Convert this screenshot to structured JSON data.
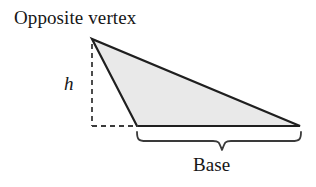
{
  "figure": {
    "kind": "geometry-diagram",
    "background_color": "#ffffff",
    "labels": {
      "opposite_vertex": "Opposite vertex",
      "height": "h",
      "base": "Base"
    },
    "colors": {
      "triangle_fill": "#e9e9e9",
      "triangle_stroke": "#1f1f1f",
      "dashed_stroke": "#3a3a3a",
      "brace_stroke": "#3a3a3a",
      "text": "#161616"
    },
    "geometry": {
      "triangle_vertices": [
        {
          "name": "apex",
          "x": 92,
          "y": 39
        },
        {
          "name": "base-left",
          "x": 137,
          "y": 126
        },
        {
          "name": "base-right",
          "x": 300,
          "y": 126
        }
      ],
      "height_line": {
        "from_x": 92,
        "from_y": 44,
        "to_x": 92,
        "to_y": 126,
        "style": "dashed"
      },
      "foot_line": {
        "from_x": 92,
        "from_y": 126,
        "to_x": 137,
        "to_y": 126,
        "style": "dashed"
      },
      "base_brace": {
        "left_x": 137,
        "right_x": 301,
        "top_y": 131,
        "depth_y": 150,
        "center_x": 222
      },
      "stroke_width_triangle": 2.2,
      "stroke_width_dashed": 1.8,
      "stroke_width_brace": 1.8,
      "dash_pattern": "5 4"
    }
  }
}
